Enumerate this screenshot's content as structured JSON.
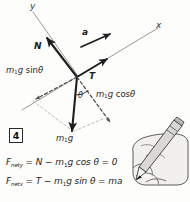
{
  "figure": {
    "marker_label": "4",
    "kind": "free-body-diagram"
  },
  "axes": {
    "y_label": "y",
    "x_label": "x"
  },
  "vectors": {
    "normal_label": "N",
    "tension_label": "T",
    "acceleration_label": "a",
    "weight_label_m": "m",
    "weight_label_sub": "1",
    "weight_label_g": "g"
  },
  "components": {
    "along_incline": {
      "m": "m",
      "sub": "1",
      "g": "g",
      "trig": "sin",
      "angle": "θ"
    },
    "perpendicular": {
      "m": "m",
      "sub": "1",
      "g": "g",
      "trig": "cos",
      "angle": "θ"
    }
  },
  "angle": {
    "symbol": "θ"
  },
  "equations": {
    "y": {
      "lhs_f": "F",
      "lhs_sub": "net",
      "lhs_axis": "y",
      "rhs": " = N − m",
      "rhs_sub": "1",
      "rhs_tail": "g cos θ = 0"
    },
    "x": {
      "lhs_f": "F",
      "lhs_sub": "net",
      "lhs_axis": "x",
      "rhs": " = T − m",
      "rhs_sub": "1",
      "rhs_tail": "g sin θ = ma"
    }
  },
  "illustration": {
    "name": "hand-holding-pencil"
  },
  "colors": {
    "ink": "#1e1e1e",
    "light_ink": "#8a8a8a",
    "paper": "#fdfdfc",
    "hand_fill": "#f0efee"
  }
}
